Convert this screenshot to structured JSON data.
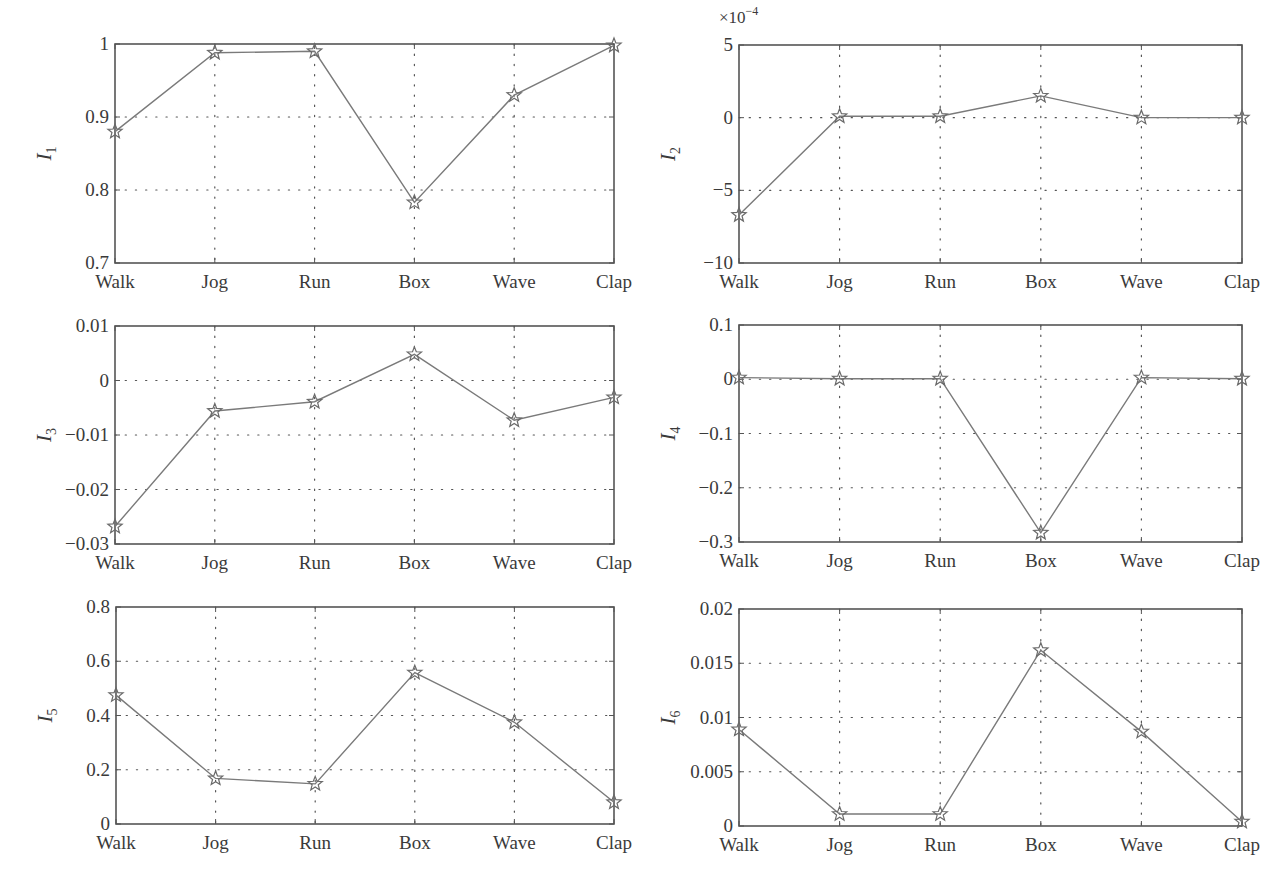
{
  "figure": {
    "line_color": "#7a7a7a",
    "marker_color": "#6a6a6a",
    "axis_color": "#555555",
    "grid_color": "#555555"
  },
  "chart_data": [
    {
      "type": "line",
      "id": "I1",
      "ylabel": "I",
      "ylabel_sub": "1",
      "categories": [
        "Walk",
        "Jog",
        "Run",
        "Box",
        "Wave",
        "Clap"
      ],
      "values": [
        0.88,
        0.988,
        0.99,
        0.783,
        0.93,
        0.998
      ],
      "ylim": [
        0.7,
        1.0
      ],
      "yticks": [
        0.7,
        0.8,
        0.9,
        1.0
      ],
      "ytick_labels": [
        "0.7",
        "0.8",
        "0.9",
        "1"
      ],
      "exponent_label": "",
      "grid": true,
      "marker": "star",
      "box": {
        "x0": 115,
        "x1": 614,
        "y0": 44,
        "y1": 263
      }
    },
    {
      "type": "line",
      "id": "I2",
      "ylabel": "I",
      "ylabel_sub": "2",
      "categories": [
        "Walk",
        "Jog",
        "Run",
        "Box",
        "Wave",
        "Clap"
      ],
      "values": [
        -6.7,
        0.1,
        0.1,
        1.5,
        0.0,
        0.0
      ],
      "value_scale": "x10^-4",
      "ylim": [
        -10,
        5
      ],
      "yticks": [
        -10,
        -5,
        0,
        5
      ],
      "ytick_labels": [
        "−10",
        "−5",
        "0",
        "5"
      ],
      "exponent_label": "×10",
      "exponent_power": "−4",
      "grid": true,
      "marker": "star",
      "box": {
        "x0": 739,
        "x1": 1242,
        "y0": 45,
        "y1": 263
      }
    },
    {
      "type": "line",
      "id": "I3",
      "ylabel": "I",
      "ylabel_sub": "3",
      "categories": [
        "Walk",
        "Jog",
        "Run",
        "Box",
        "Wave",
        "Clap"
      ],
      "values": [
        -0.0268,
        -0.0056,
        -0.0039,
        0.0048,
        -0.0073,
        -0.0031
      ],
      "ylim": [
        -0.03,
        0.01
      ],
      "yticks": [
        -0.03,
        -0.02,
        -0.01,
        0,
        0.01
      ],
      "ytick_labels": [
        "−0.03",
        "−0.02",
        "−0.01",
        "0",
        "0.01"
      ],
      "exponent_label": "",
      "grid": true,
      "marker": "star",
      "box": {
        "x0": 115,
        "x1": 614,
        "y0": 326,
        "y1": 544
      }
    },
    {
      "type": "line",
      "id": "I4",
      "ylabel": "I",
      "ylabel_sub": "4",
      "categories": [
        "Walk",
        "Jog",
        "Run",
        "Box",
        "Wave",
        "Clap"
      ],
      "values": [
        0.003,
        0.001,
        0.001,
        -0.283,
        0.003,
        0.001
      ],
      "ylim": [
        -0.3,
        0.1
      ],
      "yticks": [
        -0.3,
        -0.2,
        -0.1,
        0,
        0.1
      ],
      "ytick_labels": [
        "−0.3",
        "−0.2",
        "−0.1",
        "0",
        "0.1"
      ],
      "exponent_label": "",
      "grid": true,
      "marker": "star",
      "box": {
        "x0": 739,
        "x1": 1242,
        "y0": 325,
        "y1": 542
      }
    },
    {
      "type": "line",
      "id": "I5",
      "ylabel": "I",
      "ylabel_sub": "5",
      "categories": [
        "Walk",
        "Jog",
        "Run",
        "Box",
        "Wave",
        "Clap"
      ],
      "values": [
        0.475,
        0.168,
        0.148,
        0.558,
        0.375,
        0.08
      ],
      "ylim": [
        0,
        0.8
      ],
      "yticks": [
        0,
        0.2,
        0.4,
        0.6,
        0.8
      ],
      "ytick_labels": [
        "0",
        "0.2",
        "0.4",
        "0.6",
        "0.8"
      ],
      "exponent_label": "",
      "grid": true,
      "marker": "star",
      "box": {
        "x0": 116,
        "x1": 614,
        "y0": 607,
        "y1": 824
      }
    },
    {
      "type": "line",
      "id": "I6",
      "ylabel": "I",
      "ylabel_sub": "6",
      "categories": [
        "Walk",
        "Jog",
        "Run",
        "Box",
        "Wave",
        "Clap"
      ],
      "values": [
        0.0089,
        0.0011,
        0.0011,
        0.0162,
        0.0087,
        0.0004
      ],
      "ylim": [
        0,
        0.02
      ],
      "yticks": [
        0,
        0.005,
        0.01,
        0.015,
        0.02
      ],
      "ytick_labels": [
        "0",
        "0.005",
        "0.01",
        "0.015",
        "0.02"
      ],
      "exponent_label": "",
      "grid": true,
      "marker": "star",
      "box": {
        "x0": 739,
        "x1": 1242,
        "y0": 609,
        "y1": 826
      }
    }
  ]
}
